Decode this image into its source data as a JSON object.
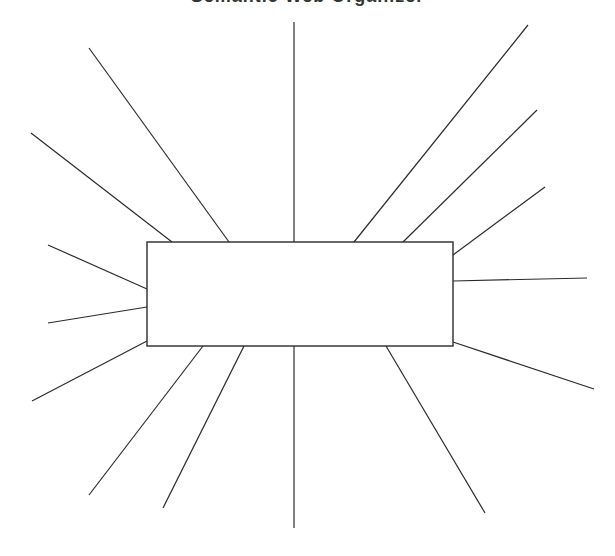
{
  "diagram": {
    "title": "Semantic Web Organizer",
    "type": "spider-map",
    "center_box": {
      "x": 147,
      "y": 242,
      "width": 306,
      "height": 104,
      "label": ""
    },
    "colors": {
      "stroke": "#2b2b2b",
      "background": "#ffffff"
    },
    "spokes": [
      {
        "id": "top-left-outer",
        "x1": 89,
        "y1": 48,
        "x2": 229,
        "y2": 242
      },
      {
        "id": "left-upper",
        "x1": 31,
        "y1": 133,
        "x2": 172,
        "y2": 242
      },
      {
        "id": "top-center",
        "x1": 294,
        "y1": 22,
        "x2": 294,
        "y2": 242
      },
      {
        "id": "top-right-outer",
        "x1": 528,
        "y1": 25,
        "x2": 354,
        "y2": 242
      },
      {
        "id": "top-right-middle",
        "x1": 537,
        "y1": 110,
        "x2": 403,
        "y2": 242
      },
      {
        "id": "right-upper",
        "x1": 545,
        "y1": 187,
        "x2": 453,
        "y2": 255
      },
      {
        "id": "right-middle",
        "x1": 587,
        "y1": 278,
        "x2": 453,
        "y2": 281
      },
      {
        "id": "right-lower",
        "x1": 594,
        "y1": 389,
        "x2": 453,
        "y2": 342
      },
      {
        "id": "bottom-right",
        "x1": 485,
        "y1": 513,
        "x2": 386,
        "y2": 346
      },
      {
        "id": "bottom-center",
        "x1": 294,
        "y1": 528,
        "x2": 294,
        "y2": 341
      },
      {
        "id": "bottom-left-inner",
        "x1": 163,
        "y1": 508,
        "x2": 244,
        "y2": 346
      },
      {
        "id": "bottom-left-outer",
        "x1": 89,
        "y1": 495,
        "x2": 203,
        "y2": 346
      },
      {
        "id": "left-lower",
        "x1": 32,
        "y1": 401,
        "x2": 147,
        "y2": 341
      },
      {
        "id": "left-middle",
        "x1": 48,
        "y1": 323,
        "x2": 147,
        "y2": 307
      },
      {
        "id": "left-top",
        "x1": 48,
        "y1": 245,
        "x2": 147,
        "y2": 289
      }
    ]
  }
}
